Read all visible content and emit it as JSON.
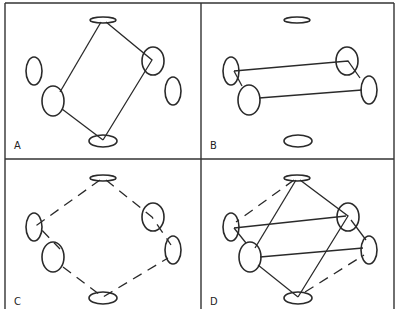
{
  "figure": {
    "type": "diagram",
    "panels": [
      {
        "id": "A",
        "label": "A",
        "connections": "solid quadrilateral linking top disc, upper-right, bottom disc, lower-left"
      },
      {
        "id": "B",
        "label": "B",
        "connections": "solid parallelogram linking left pair and right pair horizontally"
      },
      {
        "id": "C",
        "label": "C",
        "connections": "dashed hexagonal ring around all six elements"
      },
      {
        "id": "D",
        "label": "D",
        "connections": "solid quadrilateral + solid horizontal links + dashed ring combined"
      }
    ],
    "colors": {
      "stroke": "#2a2a2a",
      "background": "#ffffff",
      "frame": "#333333"
    }
  }
}
